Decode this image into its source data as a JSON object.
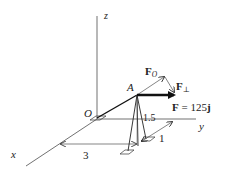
{
  "figure": {
    "axes": {
      "x_label": "x",
      "y_label": "y",
      "z_label": "z",
      "origin_label": "O"
    },
    "point_label": "A",
    "forces": {
      "F_label": "F = 125",
      "F_unit_vector": "j",
      "F_parallel_main": "F",
      "F_parallel_sub": "O",
      "F_perp_main": "F",
      "F_perp_sub": "⊥"
    },
    "dimensions": {
      "dim_x": "3",
      "dim_height": "1.5",
      "dim_y": "1"
    },
    "colors": {
      "line": "#222222",
      "background": "#ffffff"
    }
  }
}
